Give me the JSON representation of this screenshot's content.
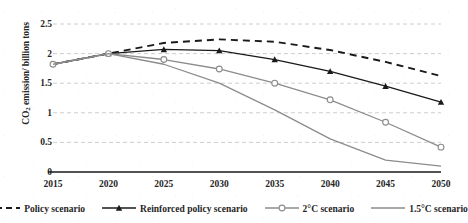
{
  "chart_data": {
    "type": "line",
    "title": "",
    "xlabel": "",
    "ylabel": "CO2 emission/ billion tons",
    "ylabel_parts": {
      "prefix": "CO",
      "sub": "2",
      "suffix": " emission/ billion tons"
    },
    "x": [
      2015,
      2020,
      2025,
      2030,
      2035,
      2040,
      2045,
      2050
    ],
    "xticklabels": [
      "2015",
      "2020",
      "2025",
      "2030",
      "2035",
      "2040",
      "2045",
      "2050"
    ],
    "yticks": [
      0,
      0.5,
      1,
      1.5,
      2,
      2.5
    ],
    "yticklabels": [
      "0",
      "0.5",
      "1",
      "1.5",
      "2",
      "2.5"
    ],
    "ylim": [
      0,
      2.5
    ],
    "xlim": [
      2015,
      2050
    ],
    "grid": "horizontal-dashed",
    "legend_position": "bottom",
    "series": [
      {
        "name": "Policy scenario",
        "style": "dashed",
        "marker": "none",
        "color": "#1a1a1a",
        "values": [
          1.82,
          2.0,
          2.18,
          2.24,
          2.2,
          2.06,
          1.86,
          1.62
        ]
      },
      {
        "name": "Reinforced policy scenario",
        "style": "solid",
        "marker": "triangle",
        "color": "#1a1a1a",
        "values": [
          1.82,
          2.0,
          2.07,
          2.05,
          1.9,
          1.7,
          1.45,
          1.18
        ]
      },
      {
        "name": "2°C scenario",
        "style": "solid",
        "marker": "circle-open",
        "color": "#8c8c8c",
        "values": [
          1.82,
          2.0,
          1.9,
          1.74,
          1.5,
          1.22,
          0.84,
          0.42
        ]
      },
      {
        "name": "1.5°C scenario",
        "style": "solid",
        "marker": "none",
        "color": "#8c8c8c",
        "values": [
          1.82,
          2.0,
          1.82,
          1.5,
          1.05,
          0.56,
          0.2,
          0.1
        ]
      }
    ],
    "legend": [
      {
        "label": "Policy scenario",
        "style": "dashed",
        "marker": "none",
        "color": "#1a1a1a"
      },
      {
        "label": "Reinforced policy scenario",
        "style": "solid",
        "marker": "triangle",
        "color": "#1a1a1a"
      },
      {
        "label": "2°C scenario",
        "style": "solid",
        "marker": "circle-open",
        "color": "#8c8c8c"
      },
      {
        "label": "1.5°C scenario",
        "style": "solid",
        "marker": "none",
        "color": "#8c8c8c"
      }
    ],
    "colors": {
      "dark": "#1a1a1a",
      "gray": "#8c8c8c",
      "grid": "#c8c8c8",
      "axis": "#1a1a1a",
      "background": "#ffffff"
    }
  }
}
